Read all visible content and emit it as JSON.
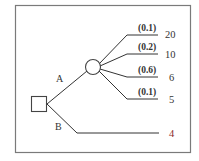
{
  "diagram": {
    "type": "decision-tree",
    "colors": {
      "frame": "#7a7a7a",
      "lines": "#333333",
      "text": "#333333",
      "highlight_payoff": "#8b2a2a"
    },
    "decision_node": {
      "shape": "square"
    },
    "branches": [
      {
        "label": "A",
        "leads_to": "chance-node",
        "outcomes": [
          {
            "probability": "(0.1)",
            "payoff": "20"
          },
          {
            "probability": "(0.2)",
            "payoff": "10"
          },
          {
            "probability": "(0.6)",
            "payoff": "6"
          },
          {
            "probability": "(0.1)",
            "payoff": "5"
          }
        ]
      },
      {
        "label": "B",
        "payoff": "4"
      }
    ]
  }
}
